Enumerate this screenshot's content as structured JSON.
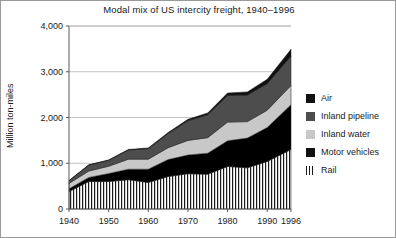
{
  "figure": {
    "ylabel_text": "Million ton-miles"
  },
  "chart_data": {
    "type": "area",
    "stacked": true,
    "title": "Modal mix of US intercity freight, 1940–1996",
    "xlabel": "",
    "ylabel": "Million ton-miles",
    "ylim": [
      0,
      4000
    ],
    "xlim": [
      1940,
      1996
    ],
    "grid": true,
    "grid_axis": "y",
    "legend_position": "right",
    "ytick_labels": [
      "0",
      "1,000",
      "2,000",
      "3,000",
      "4,000"
    ],
    "ytick_values": [
      0,
      1000,
      2000,
      3000,
      4000
    ],
    "xtick_labels": [
      "1940",
      "1950",
      "1960",
      "1970",
      "1980",
      "1990",
      "1996"
    ],
    "xtick_values": [
      1940,
      1950,
      1960,
      1970,
      1980,
      1990,
      1996
    ],
    "x": [
      1940,
      1945,
      1950,
      1955,
      1960,
      1965,
      1970,
      1975,
      1980,
      1985,
      1990,
      1996
    ],
    "series": [
      {
        "name": "Rail",
        "fill": "hatch-vertical",
        "color": "#ffffff",
        "values": [
          380,
          600,
          600,
          640,
          580,
          710,
          770,
          760,
          930,
          900,
          1040,
          1300
        ]
      },
      {
        "name": "Motor vehicles",
        "fill": "solid",
        "color": "#000000",
        "values": [
          62,
          90,
          175,
          230,
          290,
          370,
          410,
          460,
          560,
          650,
          740,
          980
        ]
      },
      {
        "name": "Inland water",
        "fill": "solid",
        "color": "#c8c8c8",
        "values": [
          118,
          140,
          160,
          220,
          220,
          260,
          320,
          340,
          410,
          360,
          380,
          420
        ]
      },
      {
        "name": "Inland pipeline",
        "fill": "solid",
        "color": "#4d4d4d",
        "values": [
          59,
          130,
          130,
          200,
          230,
          310,
          430,
          500,
          580,
          580,
          580,
          640
        ]
      },
      {
        "name": "Air",
        "fill": "solid",
        "color": "#111111",
        "values": [
          3,
          5,
          8,
          12,
          15,
          20,
          30,
          40,
          55,
          70,
          95,
          150
        ]
      }
    ]
  },
  "legend": {
    "entries": [
      {
        "label": "Air",
        "swatch": "solid-black"
      },
      {
        "label": "Inland pipeline",
        "swatch": "solid-darkgray"
      },
      {
        "label": "Inland water",
        "swatch": "solid-lightgray"
      },
      {
        "label": "Motor vehicles",
        "swatch": "solid-black"
      },
      {
        "label": "Rail",
        "swatch": "hatch-vertical"
      }
    ]
  }
}
